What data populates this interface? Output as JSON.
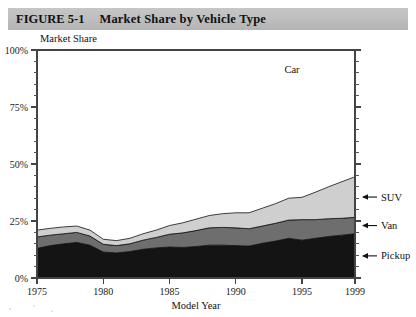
{
  "figure": {
    "number": "FIGURE 5-1",
    "title": "Market Share by Vehicle Type"
  },
  "chart_data": {
    "type": "area",
    "stacked": true,
    "title": "Market Share by Vehicle Type",
    "subtitle": "",
    "xlabel": "Model Year",
    "ylabel": "Market Share",
    "xlim": [
      1975,
      1999
    ],
    "ylim": [
      0,
      100
    ],
    "grid": false,
    "legend_position": "right-inline-callouts",
    "x_tick_labels": [
      "1975",
      "1980",
      "1985",
      "1990",
      "1995",
      "1999"
    ],
    "x_ticks": [
      1975,
      1980,
      1985,
      1990,
      1995,
      1999
    ],
    "y_tick_labels": [
      "0%",
      "25%",
      "50%",
      "75%",
      "100%"
    ],
    "y_ticks": [
      0,
      25,
      50,
      75,
      100
    ],
    "y_minor_tick_step": 5,
    "x": [
      1975,
      1976,
      1977,
      1978,
      1979,
      1980,
      1981,
      1982,
      1983,
      1984,
      1985,
      1986,
      1987,
      1988,
      1989,
      1990,
      1991,
      1992,
      1993,
      1994,
      1995,
      1996,
      1997,
      1998,
      1999
    ],
    "series": [
      {
        "name": "Pickup",
        "color": "#141414",
        "values": [
          13.0,
          14.2,
          15.0,
          15.6,
          14.4,
          11.4,
          11.0,
          11.6,
          12.6,
          13.2,
          13.6,
          13.4,
          13.8,
          14.4,
          14.4,
          14.2,
          14.0,
          15.2,
          16.2,
          17.4,
          16.6,
          17.4,
          18.2,
          18.8,
          19.4
        ]
      },
      {
        "name": "Van",
        "color": "#6e6e6e",
        "values": [
          5.0,
          4.6,
          4.4,
          4.4,
          4.0,
          3.4,
          3.2,
          3.4,
          4.0,
          4.6,
          5.6,
          6.4,
          7.0,
          7.6,
          7.8,
          7.8,
          7.6,
          7.6,
          7.8,
          8.0,
          9.0,
          8.2,
          7.8,
          7.4,
          7.2
        ]
      },
      {
        "name": "SUV",
        "color": "#cfcfcf",
        "values": [
          3.0,
          3.0,
          3.0,
          2.8,
          2.6,
          2.2,
          2.2,
          2.4,
          2.8,
          3.2,
          3.8,
          4.4,
          5.0,
          5.4,
          6.0,
          6.6,
          7.0,
          7.8,
          8.6,
          9.6,
          9.8,
          12.0,
          14.0,
          16.0,
          17.8
        ]
      },
      {
        "name": "Car",
        "color": "#ffffff",
        "values": [
          79.0,
          78.2,
          77.6,
          77.2,
          79.0,
          83.0,
          83.6,
          82.6,
          80.6,
          79.0,
          77.0,
          75.8,
          74.2,
          72.6,
          71.8,
          71.4,
          71.4,
          69.4,
          67.4,
          65.0,
          64.6,
          62.4,
          60.0,
          57.8,
          55.6
        ]
      }
    ],
    "callouts": [
      {
        "name": "SUV",
        "label": "SUV"
      },
      {
        "name": "Van",
        "label": "Van"
      },
      {
        "name": "Pickup",
        "label": "Pickup"
      }
    ],
    "inline_labels": [
      {
        "name": "Car",
        "label": "Car"
      }
    ]
  }
}
